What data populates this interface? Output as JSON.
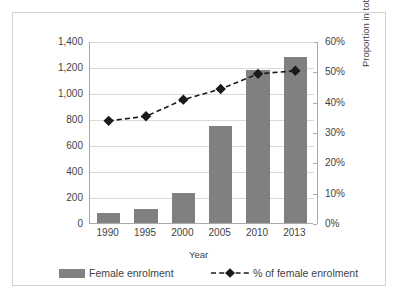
{
  "chart_data": {
    "type": "bar",
    "title": "",
    "subtitle": "",
    "xlabel": "Year",
    "ylabel": "Enrolment (ten thousand)",
    "y2label": "Proportion in total",
    "categories": [
      "1990",
      "1995",
      "2000",
      "2005",
      "2010",
      "2013"
    ],
    "ylim": [
      0,
      1400
    ],
    "y2lim": [
      0,
      0.6
    ],
    "yticks": [
      "0",
      "200",
      "400",
      "600",
      "800",
      "1,000",
      "1,200",
      "1,400"
    ],
    "ytick_values": [
      0,
      200,
      400,
      600,
      800,
      1000,
      1200,
      1400
    ],
    "y2ticks": [
      "0%",
      "10%",
      "20%",
      "30%",
      "40%",
      "50%",
      "60%"
    ],
    "y2tick_values": [
      0,
      10,
      20,
      30,
      40,
      50,
      60
    ],
    "grid": true,
    "legend_position": "bottom",
    "series": [
      {
        "name": "Female enrolment",
        "type": "bar",
        "axis": "left",
        "color": "#808080",
        "values": [
          80,
          105,
          230,
          745,
          1180,
          1275
        ]
      },
      {
        "name": "% of female enrolment",
        "type": "line",
        "axis": "right",
        "color": "#1a1a1a",
        "linestyle": "dashed",
        "marker": "diamond",
        "values": [
          34.0,
          35.5,
          41.0,
          44.5,
          49.5,
          50.5
        ]
      }
    ]
  },
  "legend": {
    "bar_label": "Female enrolment",
    "line_label": "% of female enrolment"
  },
  "axes": {
    "x_title": "Year",
    "y_left_title": "Enrolment (ten thousand)",
    "y_right_title": "Proportion in total"
  }
}
